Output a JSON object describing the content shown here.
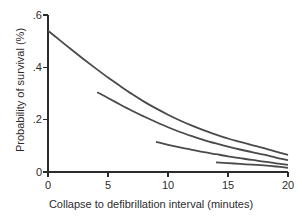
{
  "chart_data": {
    "type": "line",
    "title": "",
    "subtitle": "",
    "xlabel": "Collapse to defibrillation interval (minutes)",
    "ylabel": "Probability of survival (%)",
    "xlim": [
      0,
      20
    ],
    "ylim": [
      0,
      0.6
    ],
    "xticks": [
      0,
      5,
      10,
      15,
      20
    ],
    "xticklabels": [
      "0",
      "5",
      "10",
      "15",
      "20"
    ],
    "yticks": [
      0,
      0.2,
      0.4,
      0.6
    ],
    "yticklabels": [
      "0",
      ".2",
      ".4",
      ".6"
    ],
    "grid": false,
    "legend": "none",
    "line_color": "#4a4a4a",
    "line_width": 1.8,
    "axis_color": "#2b2b2b",
    "background": "#ffffff",
    "spines": [
      "left",
      "bottom"
    ],
    "series": [
      {
        "name": "curve-1",
        "x": [
          0,
          1,
          2,
          3,
          4,
          5,
          6,
          7,
          8,
          9,
          10,
          11,
          12,
          13,
          14,
          15,
          16,
          17,
          18,
          19,
          20
        ],
        "y": [
          0.54,
          0.503,
          0.466,
          0.43,
          0.395,
          0.361,
          0.329,
          0.298,
          0.269,
          0.243,
          0.219,
          0.197,
          0.177,
          0.159,
          0.143,
          0.128,
          0.115,
          0.103,
          0.091,
          0.078,
          0.065
        ]
      },
      {
        "name": "curve-2",
        "x": [
          4.1,
          5,
          6,
          7,
          8,
          9,
          10,
          11,
          12,
          13,
          14,
          15,
          16,
          17,
          18,
          19,
          20
        ],
        "y": [
          0.305,
          0.283,
          0.258,
          0.234,
          0.212,
          0.191,
          0.171,
          0.153,
          0.137,
          0.122,
          0.109,
          0.097,
          0.086,
          0.076,
          0.066,
          0.055,
          0.045
        ]
      },
      {
        "name": "curve-3",
        "x": [
          9,
          10,
          11,
          12,
          13,
          14,
          15,
          16,
          17,
          18,
          19,
          20
        ],
        "y": [
          0.115,
          0.104,
          0.094,
          0.085,
          0.076,
          0.068,
          0.06,
          0.053,
          0.046,
          0.04,
          0.033,
          0.027
        ]
      },
      {
        "name": "curve-4",
        "x": [
          14,
          15,
          16,
          17,
          18,
          19,
          20
        ],
        "y": [
          0.037,
          0.034,
          0.031,
          0.028,
          0.025,
          0.021,
          0.016
        ]
      }
    ]
  }
}
